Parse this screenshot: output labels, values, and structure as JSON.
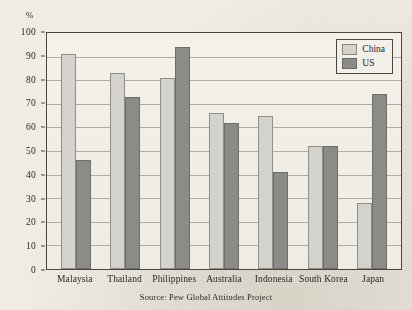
{
  "chart_data": {
    "type": "bar",
    "title": "",
    "subtitle": "",
    "xlabel": "",
    "ylabel": "%",
    "ylim": [
      0,
      100
    ],
    "yticks": [
      0,
      10,
      20,
      30,
      40,
      50,
      60,
      70,
      80,
      90,
      100
    ],
    "ytick_labels": [
      "0",
      "10",
      "20",
      "30",
      "40",
      "50",
      "60",
      "70",
      "80",
      "90",
      "100"
    ],
    "grid": true,
    "legend_position": "top-right",
    "categories": [
      "Malaysia",
      "Thailand",
      "Philippines",
      "Australia",
      "Indonesia",
      "South Korea",
      "Japan"
    ],
    "series": [
      {
        "name": "China",
        "color": "#d3d2cc",
        "values": [
          91,
          83,
          81,
          66,
          65,
          52,
          28
        ]
      },
      {
        "name": "US",
        "color": "#8b8b87",
        "values": [
          46,
          73,
          94,
          62,
          41,
          52,
          74
        ]
      }
    ],
    "annotations": [
      "Source: Pew Global Attitudes Project"
    ]
  },
  "axis": {
    "unit_label": "%"
  },
  "legend": {
    "entries": [
      {
        "label": "China"
      },
      {
        "label": "US"
      }
    ]
  },
  "footer": {
    "source": "Source: Pew Global Attitudes Project"
  },
  "colors": {
    "paper": "#efece4",
    "plot_background": "#f2efe8",
    "frame": "#4a4540",
    "gridline": "#9c968c",
    "china": "#d3d2cc",
    "us": "#8b8b87"
  }
}
